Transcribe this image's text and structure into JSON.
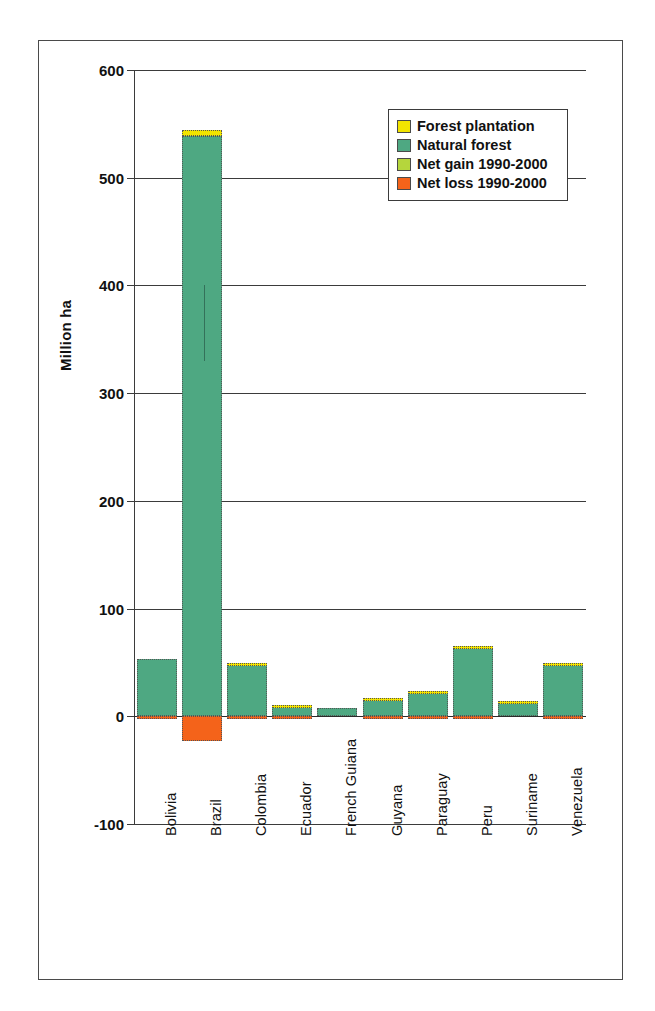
{
  "chart_data": {
    "type": "bar",
    "title": "",
    "subtitle": "",
    "xlabel": "",
    "ylabel": "Million ha",
    "ylim": [
      -100,
      600
    ],
    "yticks": [
      -100,
      0,
      100,
      200,
      300,
      400,
      500,
      600
    ],
    "ytick_labels": [
      "-100",
      "0",
      "100",
      "200",
      "300",
      "400",
      "500",
      "600"
    ],
    "grid": true,
    "stacked": true,
    "legend_position": "top-right",
    "categories": [
      "Bolivia",
      "Brazil",
      "Colombia",
      "Ecuador",
      "French Guiana",
      "Guyana",
      "Paraguay",
      "Peru",
      "Suriname",
      "Venezuela"
    ],
    "series": [
      {
        "name": "Forest plantation",
        "color": "#f2e400",
        "values": [
          0,
          5,
          0.2,
          0.2,
          0,
          0.1,
          0.1,
          0.6,
          0.1,
          0.9
        ]
      },
      {
        "name": "Natural forest",
        "color": "#4ea882",
        "values": [
          53,
          539,
          49,
          10.5,
          8,
          17,
          23,
          64.5,
          14,
          49
        ]
      },
      {
        "name": "Net gain 1990-2000",
        "color": "#b5d63c",
        "values": [
          0,
          0,
          0,
          0,
          0,
          0,
          0,
          0,
          0,
          0
        ]
      },
      {
        "name": "Net loss 1990-2000",
        "color": "#f4631a",
        "values": [
          -1.5,
          -23,
          -2,
          -1.5,
          0,
          -0.5,
          -1.5,
          -2.5,
          0,
          -2
        ]
      }
    ]
  },
  "legend": {
    "entries": [
      {
        "label": "Forest plantation",
        "color": "#f2e400"
      },
      {
        "label": "Natural forest",
        "color": "#4ea882"
      },
      {
        "label": "Net gain 1990-2000",
        "color": "#b5d63c"
      },
      {
        "label": "Net loss 1990-2000",
        "color": "#f4631a"
      }
    ]
  }
}
